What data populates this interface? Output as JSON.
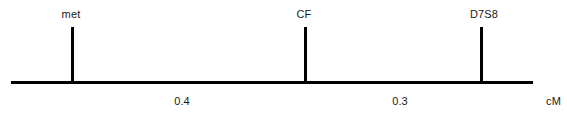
{
  "figure": {
    "width": 567,
    "height": 118,
    "background_color": "#ffffff",
    "line_color": "#000000",
    "text_color": "#1a1a1a"
  },
  "axis": {
    "name": "map-axis",
    "x": 11,
    "y": 81,
    "length": 522,
    "thickness": 3
  },
  "markers": [
    {
      "label": "met",
      "tick_x": 72,
      "tick_top": 27,
      "tick_bottom": 84,
      "tick_width": 3,
      "label_x": 71,
      "label_y": 8
    },
    {
      "label": "CF",
      "tick_x": 305,
      "tick_top": 27,
      "tick_bottom": 84,
      "tick_width": 3,
      "label_x": 304,
      "label_y": 8
    },
    {
      "label": "D7S8",
      "tick_x": 481,
      "tick_top": 27,
      "tick_bottom": 84,
      "tick_width": 3,
      "label_x": 484,
      "label_y": 8
    }
  ],
  "intervals": [
    {
      "label": "0.4",
      "from": "met",
      "to": "CF",
      "center_x": 182,
      "label_y": 95
    },
    {
      "label": "0.3",
      "from": "CF",
      "to": "D7S8",
      "center_x": 400,
      "label_y": 95
    }
  ],
  "unit": {
    "label": "cM",
    "x": 546,
    "y": 95
  },
  "chart_data": {
    "type": "line",
    "title": "",
    "subtitle": "",
    "xlabel": "cM",
    "ylabel": "",
    "grid": false,
    "legend": null,
    "categories": [
      "met",
      "CF",
      "D7S8"
    ],
    "x": [
      0.0,
      0.4,
      0.7
    ],
    "values": [
      0.0,
      0.4,
      0.7
    ],
    "annotations": [
      "0.4",
      "0.3",
      "cM"
    ],
    "series": [
      {
        "name": "genetic-map-markers",
        "points": [
          {
            "locus": "met",
            "position_cM": 0.0
          },
          {
            "locus": "CF",
            "position_cM": 0.4
          },
          {
            "locus": "D7S8",
            "position_cM": 0.7
          }
        ]
      }
    ],
    "intervals": [
      {
        "from": "met",
        "to": "CF",
        "distance_cM": 0.4
      },
      {
        "from": "CF",
        "to": "D7S8",
        "distance_cM": 0.3
      }
    ],
    "xlim": [
      0.0,
      0.7
    ],
    "tick_labels": [
      "met",
      "CF",
      "D7S8"
    ]
  }
}
